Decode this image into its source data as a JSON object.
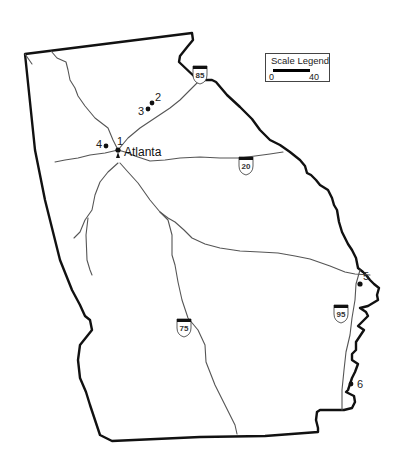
{
  "map": {
    "region": "Georgia",
    "city_label": "Atlanta",
    "sites": [
      {
        "id": "1",
        "label": "1"
      },
      {
        "id": "2",
        "label": "2"
      },
      {
        "id": "3",
        "label": "3"
      },
      {
        "id": "4",
        "label": "4"
      },
      {
        "id": "5",
        "label": "5"
      },
      {
        "id": "6",
        "label": "6"
      }
    ],
    "interstates": [
      {
        "id": "i85",
        "label": "85"
      },
      {
        "id": "i20",
        "label": "20"
      },
      {
        "id": "i75",
        "label": "75"
      },
      {
        "id": "i95",
        "label": "95"
      }
    ]
  },
  "legend": {
    "title": "Scale Legend",
    "min": "0",
    "max": "40"
  },
  "colors": {
    "border": "#111111",
    "road": "#555555",
    "background": "#ffffff"
  }
}
